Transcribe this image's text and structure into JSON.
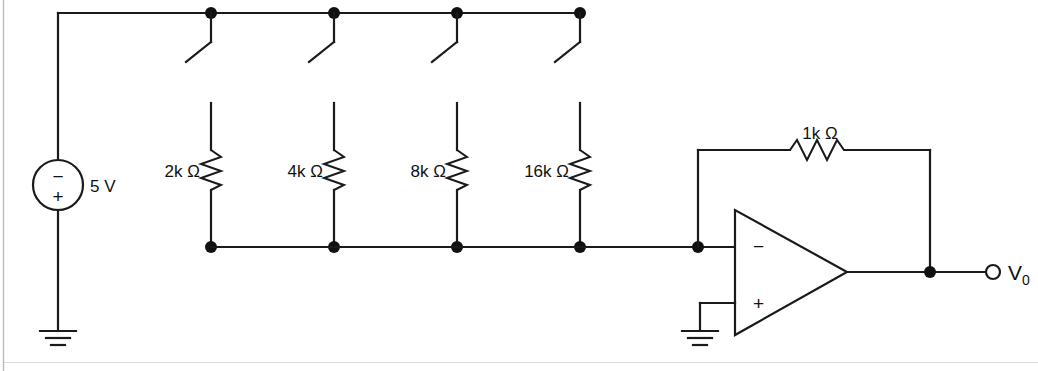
{
  "figure": {
    "type": "circuit-schematic",
    "background_color": "#ffffff",
    "line_color": "#1a1a1a"
  },
  "source": {
    "name": "voltage-source",
    "value_label": "5 V",
    "polarity_top": "−",
    "polarity_bottom": "+",
    "center_x": 58,
    "center_y": 185
  },
  "switches": [
    {
      "name": "switch-1",
      "state": "open",
      "node_x": 211
    },
    {
      "name": "switch-2",
      "state": "open",
      "node_x": 334
    },
    {
      "name": "switch-3",
      "state": "open",
      "node_x": 457
    },
    {
      "name": "switch-4",
      "state": "open",
      "node_x": 580
    }
  ],
  "resistors": [
    {
      "name": "resistor-2k",
      "label": "2k Ω",
      "value": 2,
      "unit": "kΩ",
      "x": 211,
      "label_x": 200
    },
    {
      "name": "resistor-4k",
      "label": "4k Ω",
      "value": 4,
      "unit": "kΩ",
      "x": 334,
      "label_x": 323
    },
    {
      "name": "resistor-8k",
      "label": "8k Ω",
      "value": 8,
      "unit": "kΩ",
      "x": 457,
      "label_x": 446
    },
    {
      "name": "resistor-16k",
      "label": "16k Ω",
      "value": 16,
      "unit": "kΩ",
      "x": 580,
      "label_x": 569
    }
  ],
  "feedback": {
    "name": "resistor-1k-feedback",
    "label": "1k Ω",
    "value": 1,
    "unit": "kΩ",
    "label_x": 820,
    "label_y": 139
  },
  "opamp": {
    "name": "operational-amplifier",
    "inverting_label": "−",
    "noninverting_label": "+",
    "inverting_y": 246,
    "noninverting_y": 303
  },
  "output": {
    "name": "output-terminal",
    "label": "V",
    "subscript": "0",
    "terminal_x": 995,
    "terminal_y": 272
  },
  "grounds": [
    {
      "name": "ground-source",
      "x": 58,
      "y": 330
    },
    {
      "name": "ground-opamp",
      "x": 700,
      "y": 330
    }
  ],
  "rails": {
    "top_y": 13,
    "bottom_y": 247,
    "left_x": 58,
    "right_x": 580
  }
}
